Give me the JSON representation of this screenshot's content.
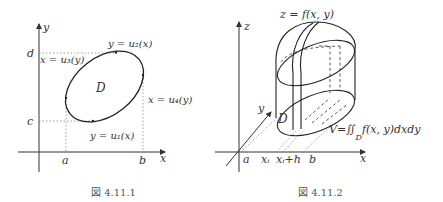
{
  "figure1": {
    "caption": "図 4.11.1",
    "axis_x": "x",
    "axis_y": "y",
    "tick_a": "a",
    "tick_b": "b",
    "tick_c": "c",
    "tick_d": "d",
    "region": "D",
    "curve_top": "y = u₂(x)",
    "curve_bottom": "y = u₁(x)",
    "curve_left": "x = u₃(y)",
    "curve_right": "x = u₄(y)"
  },
  "figure2": {
    "caption": "図 4.11.2",
    "axis_x": "x",
    "axis_y": "y",
    "axis_z": "z",
    "surface": "z = f(x, y)",
    "region": "D",
    "tick_a": "a",
    "tick_xi": "xᵢ",
    "tick_xih": "xᵢ+h",
    "tick_b": "b",
    "volume_formula": "V=∬",
    "volume_sub": "D",
    "volume_integrand": "f(x, y)dxdy"
  },
  "colors": {
    "ink": "#333333",
    "dotted": "#888888",
    "caption": "#555555"
  }
}
